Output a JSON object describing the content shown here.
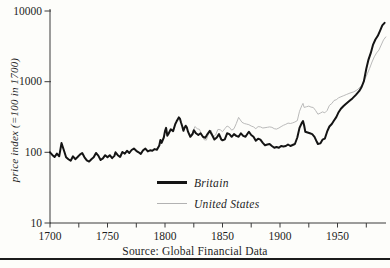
{
  "page": {
    "background": "#fdfdfa",
    "axis_color": "#3a3a3a",
    "text_color": "#1e1e1e",
    "bottom_rule_color": "#1c1c1c"
  },
  "chart_data": {
    "type": "line",
    "title": "",
    "xlabel": "",
    "ylabel": "price index (=100 in 1700)",
    "source_note": "Source: Global Financial Data",
    "y_scale": "log",
    "ylim": [
      10,
      10000
    ],
    "xlim": [
      1700,
      1992
    ],
    "y_ticks": [
      10,
      100,
      1000,
      10000
    ],
    "y_tick_labels": [
      "10",
      "100",
      "1000",
      "10000"
    ],
    "x_ticks_labeled": [
      1700,
      1750,
      1800,
      1850,
      1900,
      1950
    ],
    "x_ticks_minor": [
      1725,
      1775,
      1825,
      1875,
      1925,
      1975
    ],
    "grid": false,
    "legend_position": "inside-bottom-center",
    "series": [
      {
        "name": "Britain",
        "color": "#141414",
        "stroke_width": 2.0,
        "points": [
          [
            1700,
            100
          ],
          [
            1702,
            92
          ],
          [
            1704,
            86
          ],
          [
            1706,
            96
          ],
          [
            1708,
            88
          ],
          [
            1710,
            135
          ],
          [
            1712,
            108
          ],
          [
            1714,
            85
          ],
          [
            1716,
            80
          ],
          [
            1718,
            76
          ],
          [
            1720,
            88
          ],
          [
            1722,
            80
          ],
          [
            1724,
            86
          ],
          [
            1726,
            93
          ],
          [
            1728,
            98
          ],
          [
            1730,
            85
          ],
          [
            1732,
            77
          ],
          [
            1734,
            74
          ],
          [
            1736,
            80
          ],
          [
            1738,
            85
          ],
          [
            1740,
            98
          ],
          [
            1742,
            90
          ],
          [
            1744,
            78
          ],
          [
            1746,
            82
          ],
          [
            1748,
            91
          ],
          [
            1750,
            85
          ],
          [
            1752,
            91
          ],
          [
            1754,
            83
          ],
          [
            1756,
            89
          ],
          [
            1757,
            100
          ],
          [
            1759,
            91
          ],
          [
            1761,
            86
          ],
          [
            1763,
            101
          ],
          [
            1765,
            96
          ],
          [
            1767,
            105
          ],
          [
            1769,
            98
          ],
          [
            1771,
            108
          ],
          [
            1773,
            113
          ],
          [
            1775,
            105
          ],
          [
            1777,
            100
          ],
          [
            1779,
            95
          ],
          [
            1781,
            107
          ],
          [
            1783,
            113
          ],
          [
            1785,
            103
          ],
          [
            1787,
            107
          ],
          [
            1789,
            105
          ],
          [
            1791,
            111
          ],
          [
            1793,
            109
          ],
          [
            1795,
            125
          ],
          [
            1796,
            150
          ],
          [
            1797,
            136
          ],
          [
            1799,
            162
          ],
          [
            1800,
            200
          ],
          [
            1801,
            222
          ],
          [
            1802,
            172
          ],
          [
            1803,
            182
          ],
          [
            1805,
            212
          ],
          [
            1807,
            200
          ],
          [
            1809,
            252
          ],
          [
            1810,
            272
          ],
          [
            1812,
            312
          ],
          [
            1813,
            300
          ],
          [
            1814,
            262
          ],
          [
            1815,
            232
          ],
          [
            1816,
            202
          ],
          [
            1817,
            222
          ],
          [
            1818,
            238
          ],
          [
            1819,
            226
          ],
          [
            1820,
            196
          ],
          [
            1822,
            166
          ],
          [
            1824,
            182
          ],
          [
            1825,
            206
          ],
          [
            1827,
            186
          ],
          [
            1829,
            176
          ],
          [
            1831,
            186
          ],
          [
            1833,
            166
          ],
          [
            1835,
            161
          ],
          [
            1837,
            181
          ],
          [
            1839,
            201
          ],
          [
            1841,
            176
          ],
          [
            1843,
            152
          ],
          [
            1845,
            162
          ],
          [
            1847,
            181
          ],
          [
            1849,
            152
          ],
          [
            1850,
            148
          ],
          [
            1852,
            153
          ],
          [
            1854,
            186
          ],
          [
            1856,
            181
          ],
          [
            1858,
            166
          ],
          [
            1860,
            181
          ],
          [
            1862,
            171
          ],
          [
            1864,
            166
          ],
          [
            1866,
            186
          ],
          [
            1868,
            171
          ],
          [
            1870,
            166
          ],
          [
            1872,
            186
          ],
          [
            1873,
            196
          ],
          [
            1875,
            176
          ],
          [
            1877,
            166
          ],
          [
            1879,
            146
          ],
          [
            1881,
            156
          ],
          [
            1883,
            151
          ],
          [
            1885,
            136
          ],
          [
            1887,
            126
          ],
          [
            1889,
            129
          ],
          [
            1891,
            131
          ],
          [
            1893,
            123
          ],
          [
            1895,
            116
          ],
          [
            1897,
            119
          ],
          [
            1899,
            116
          ],
          [
            1901,
            123
          ],
          [
            1903,
            121
          ],
          [
            1905,
            123
          ],
          [
            1907,
            129
          ],
          [
            1909,
            123
          ],
          [
            1911,
            127
          ],
          [
            1913,
            131
          ],
          [
            1915,
            162
          ],
          [
            1917,
            222
          ],
          [
            1919,
            262
          ],
          [
            1920,
            278
          ],
          [
            1921,
            242
          ],
          [
            1922,
            196
          ],
          [
            1924,
            191
          ],
          [
            1926,
            186
          ],
          [
            1928,
            181
          ],
          [
            1930,
            166
          ],
          [
            1932,
            141
          ],
          [
            1933,
            131
          ],
          [
            1935,
            134
          ],
          [
            1937,
            151
          ],
          [
            1939,
            156
          ],
          [
            1941,
            196
          ],
          [
            1943,
            232
          ],
          [
            1945,
            252
          ],
          [
            1947,
            282
          ],
          [
            1949,
            315
          ],
          [
            1951,
            370
          ],
          [
            1953,
            415
          ],
          [
            1955,
            450
          ],
          [
            1957,
            480
          ],
          [
            1960,
            530
          ],
          [
            1963,
            580
          ],
          [
            1966,
            650
          ],
          [
            1969,
            740
          ],
          [
            1971,
            840
          ],
          [
            1973,
            1020
          ],
          [
            1975,
            1520
          ],
          [
            1977,
            2050
          ],
          [
            1979,
            2550
          ],
          [
            1981,
            3350
          ],
          [
            1983,
            3950
          ],
          [
            1985,
            4450
          ],
          [
            1987,
            5250
          ],
          [
            1989,
            6250
          ],
          [
            1991,
            6800
          ]
        ]
      },
      {
        "name": "United States",
        "color": "#b2b2b2",
        "stroke_width": 0.9,
        "points": [
          [
            1820,
            196
          ],
          [
            1822,
            176
          ],
          [
            1824,
            192
          ],
          [
            1826,
            232
          ],
          [
            1828,
            216
          ],
          [
            1830,
            211
          ],
          [
            1832,
            176
          ],
          [
            1834,
            151
          ],
          [
            1836,
            149
          ],
          [
            1838,
            186
          ],
          [
            1840,
            206
          ],
          [
            1842,
            166
          ],
          [
            1844,
            176
          ],
          [
            1846,
            211
          ],
          [
            1848,
            209
          ],
          [
            1850,
            196
          ],
          [
            1852,
            216
          ],
          [
            1854,
            236
          ],
          [
            1856,
            226
          ],
          [
            1858,
            206
          ],
          [
            1860,
            216
          ],
          [
            1862,
            256
          ],
          [
            1864,
            312
          ],
          [
            1865,
            296
          ],
          [
            1867,
            266
          ],
          [
            1869,
            256
          ],
          [
            1871,
            251
          ],
          [
            1873,
            246
          ],
          [
            1875,
            236
          ],
          [
            1877,
            229
          ],
          [
            1879,
            216
          ],
          [
            1881,
            231
          ],
          [
            1883,
            229
          ],
          [
            1885,
            221
          ],
          [
            1887,
            223
          ],
          [
            1889,
            226
          ],
          [
            1891,
            229
          ],
          [
            1893,
            226
          ],
          [
            1895,
            216
          ],
          [
            1897,
            213
          ],
          [
            1899,
            221
          ],
          [
            1901,
            231
          ],
          [
            1903,
            241
          ],
          [
            1905,
            249
          ],
          [
            1907,
            259
          ],
          [
            1909,
            256
          ],
          [
            1911,
            261
          ],
          [
            1913,
            269
          ],
          [
            1915,
            281
          ],
          [
            1917,
            381
          ],
          [
            1919,
            461
          ],
          [
            1920,
            492
          ],
          [
            1921,
            432
          ],
          [
            1923,
            441
          ],
          [
            1925,
            451
          ],
          [
            1927,
            436
          ],
          [
            1929,
            431
          ],
          [
            1931,
            391
          ],
          [
            1933,
            346
          ],
          [
            1935,
            359
          ],
          [
            1937,
            373
          ],
          [
            1939,
            363
          ],
          [
            1941,
            391
          ],
          [
            1943,
            461
          ],
          [
            1945,
            491
          ],
          [
            1947,
            541
          ],
          [
            1949,
            556
          ],
          [
            1951,
            591
          ],
          [
            1953,
            611
          ],
          [
            1955,
            631
          ],
          [
            1958,
            661
          ],
          [
            1961,
            691
          ],
          [
            1964,
            716
          ],
          [
            1967,
            761
          ],
          [
            1970,
            851
          ],
          [
            1972,
            931
          ],
          [
            1974,
            1101
          ],
          [
            1976,
            1301
          ],
          [
            1978,
            1551
          ],
          [
            1980,
            1901
          ],
          [
            1982,
            2251
          ],
          [
            1984,
            2551
          ],
          [
            1986,
            2801
          ],
          [
            1988,
            3301
          ],
          [
            1990,
            3901
          ],
          [
            1992,
            4301
          ]
        ]
      }
    ]
  }
}
